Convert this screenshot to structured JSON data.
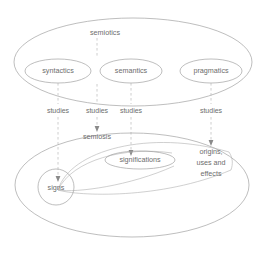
{
  "figure": {
    "title": "semiotics",
    "caption": "",
    "type": "nested-ellipse concept diagram",
    "stroke_color": "#9a9a9a",
    "text_color": "#6d6d6d",
    "background": "#ffffff"
  },
  "upper": {
    "container_label": "semiotics",
    "branches": [
      {
        "label": "syntactics",
        "cx": 58,
        "cy": 71
      },
      {
        "label": "semantics",
        "cx": 131,
        "cy": 71
      },
      {
        "label": "pragmatics",
        "cx": 211,
        "cy": 71
      }
    ]
  },
  "connectors": [
    {
      "label": "studies",
      "x": 58
    },
    {
      "label": "studies",
      "x": 97
    },
    {
      "label": "studies",
      "x": 131
    },
    {
      "label": "studies",
      "x": 211
    }
  ],
  "lower": {
    "container_label": "semiosis",
    "nodes": [
      {
        "label": "signs",
        "shape": "circle"
      },
      {
        "label": "significations",
        "shape": "ellipse"
      },
      {
        "label_lines": [
          "origins,",
          "uses  and",
          "effects"
        ],
        "shape": "text"
      }
    ],
    "origins_line1": "origins,",
    "origins_line2": "uses  and",
    "origins_line3": "effects"
  }
}
